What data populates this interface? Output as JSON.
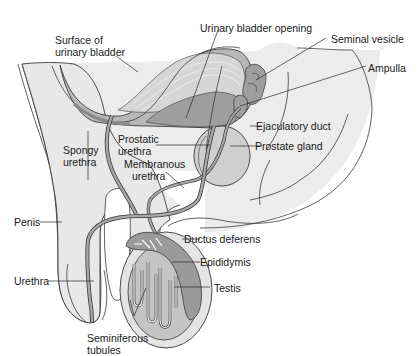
{
  "figure": {
    "labels": {
      "surface_of_urinary_bladder": [
        "Surface of",
        "urinary bladder"
      ],
      "urinary_bladder_opening": "Urinary bladder opening",
      "seminal_vesicle": "Seminal vesicle",
      "ampulla": "Ampulla",
      "prostatic_urethra": [
        "Prostatic",
        "urethra"
      ],
      "ejaculatory_duct": "Ejaculatory duct",
      "prostate_gland": "Prostate gland",
      "spongy_urethra": [
        "Spongy",
        "urethra"
      ],
      "membranous_urethra": [
        "Membranous",
        "urethra"
      ],
      "penis": "Penis",
      "ductus_deferens": "Ductus deferens",
      "epididymis": "Epididymis",
      "urethra": "Urethra",
      "testis": "Testis",
      "seminiferous_tubules": [
        "Seminiferous",
        "tubules"
      ]
    },
    "colors": {
      "body_fill": "#e9e9e9",
      "organ_fill": "#c8c8c8",
      "duct_fill": "#9a9a9a",
      "outline": "#3a3a3a",
      "text": "#1a1a1a"
    }
  }
}
